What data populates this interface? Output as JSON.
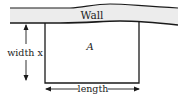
{
  "diagram": {
    "wall_label": "Wall",
    "area_label": "A",
    "width_label": "width x",
    "length_label": "length",
    "colors": {
      "stroke": "#1a1a1a",
      "wall_fill": "#ececec",
      "text": "#222222"
    }
  }
}
